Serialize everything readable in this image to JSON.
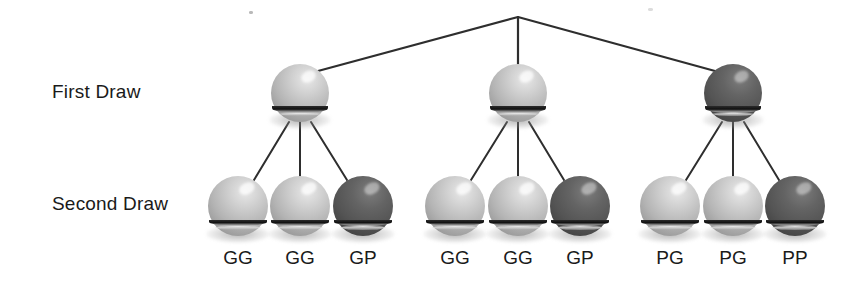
{
  "diagram": {
    "canvas": {
      "width": 861,
      "height": 285
    },
    "background_color": "#ffffff",
    "edge_color": "#2e2e2e",
    "ball_light_color": "#b4b4b4",
    "ball_dark_color": "#545454",
    "row_labels": {
      "first_draw": "First Draw",
      "second_draw": "Second Draw"
    },
    "root": {
      "x": 518,
      "y": 17
    },
    "first_draw_nodes": [
      {
        "id": "n1",
        "ball": "G",
        "shade": "light",
        "x": 300,
        "y": 93,
        "r": 29
      },
      {
        "id": "n2",
        "ball": "G",
        "shade": "light",
        "x": 518,
        "y": 93,
        "r": 29
      },
      {
        "id": "n3",
        "ball": "P",
        "shade": "dark",
        "x": 733,
        "y": 93,
        "r": 29
      }
    ],
    "second_draw_nodes": [
      {
        "id": "n1a",
        "parent": "n1",
        "ball": "G",
        "shade": "light",
        "x": 238,
        "y": 206,
        "r": 30,
        "label": "GG"
      },
      {
        "id": "n1b",
        "parent": "n1",
        "ball": "G",
        "shade": "light",
        "x": 300,
        "y": 206,
        "r": 30,
        "label": "GG"
      },
      {
        "id": "n1c",
        "parent": "n1",
        "ball": "P",
        "shade": "dark",
        "x": 363,
        "y": 206,
        "r": 30,
        "label": "GP"
      },
      {
        "id": "n2a",
        "parent": "n2",
        "ball": "G",
        "shade": "light",
        "x": 455,
        "y": 206,
        "r": 30,
        "label": "GG"
      },
      {
        "id": "n2b",
        "parent": "n2",
        "ball": "G",
        "shade": "light",
        "x": 518,
        "y": 206,
        "r": 30,
        "label": "GG"
      },
      {
        "id": "n2c",
        "parent": "n2",
        "ball": "P",
        "shade": "dark",
        "x": 580,
        "y": 206,
        "r": 30,
        "label": "GP"
      },
      {
        "id": "n3a",
        "parent": "n3",
        "ball": "G",
        "shade": "light",
        "x": 670,
        "y": 206,
        "r": 30,
        "label": "PG"
      },
      {
        "id": "n3b",
        "parent": "n3",
        "ball": "G",
        "shade": "light",
        "x": 733,
        "y": 206,
        "r": 30,
        "label": "PG"
      },
      {
        "id": "n3c",
        "parent": "n3",
        "ball": "P",
        "shade": "dark",
        "x": 795,
        "y": 206,
        "r": 30,
        "label": "PP"
      }
    ],
    "outcome_labels": [
      "GG",
      "GG",
      "GP",
      "GG",
      "GG",
      "GP",
      "PG",
      "PG",
      "PP"
    ],
    "label_y": 247
  }
}
